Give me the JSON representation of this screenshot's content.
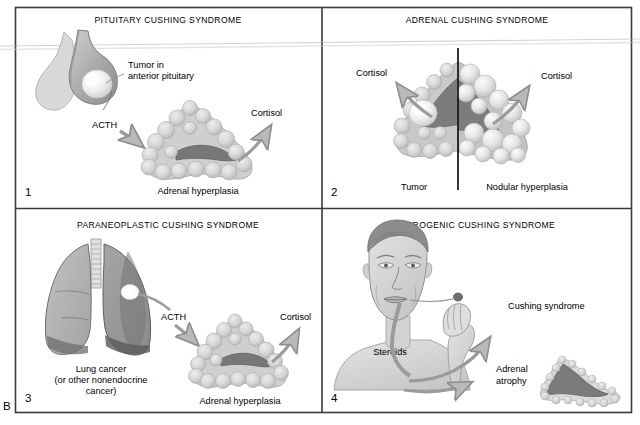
{
  "figure": {
    "panel_letter": "B",
    "background": "#ffffff",
    "frame_color": "#3a3a3a",
    "palette": {
      "cortex_light": "#d2d2d2",
      "cortex_mid": "#bdbdbd",
      "medulla_dark": "#6f6f6f",
      "nodule_light": "#e9e9e9",
      "tissue_gray": "#b5b5b5",
      "tissue_dark": "#8a8a8a",
      "arrow_gray": "#8d8d8d",
      "skin": "#dcdcdc",
      "hair_dark": "#808080",
      "text": "#1a1a1a"
    },
    "panels": [
      {
        "number": "1",
        "title": "PITUITARY CUSHING SYNDROME",
        "labels": [
          {
            "name": "tumor-label",
            "line1": "Tumor in",
            "line2": "anterior pituitary"
          },
          {
            "name": "acth-label",
            "text": "ACTH"
          },
          {
            "name": "cortisol-label",
            "text": "Cortisol"
          },
          {
            "name": "adrenal-caption",
            "text": "Adrenal hyperplasia"
          }
        ],
        "illustrations": [
          "pituitary-gland",
          "adrenal-hyperplasia-gland"
        ]
      },
      {
        "number": "2",
        "title": "ADRENAL CUSHING SYNDROME",
        "labels": [
          {
            "name": "cortisol-left-label",
            "text": "Cortisol"
          },
          {
            "name": "cortisol-right-label",
            "text": "Cortisol"
          },
          {
            "name": "tumor-caption",
            "text": "Tumor"
          },
          {
            "name": "nodular-caption",
            "text": "Nodular hyperplasia"
          }
        ],
        "illustrations": [
          "adrenal-tumor-gland",
          "adrenal-nodular-gland",
          "vertical-divider"
        ]
      },
      {
        "number": "3",
        "title": "PARANEOPLASTIC CUSHING SYNDROME",
        "labels": [
          {
            "name": "acth-label",
            "text": "ACTH"
          },
          {
            "name": "cortisol-label",
            "text": "Cortisol"
          },
          {
            "name": "lung-caption-line1",
            "text": "Lung cancer"
          },
          {
            "name": "lung-caption-line2",
            "text": "(or other nonendocrine"
          },
          {
            "name": "lung-caption-line3",
            "text": "cancer)"
          },
          {
            "name": "adrenal-caption",
            "text": "Adrenal hyperplasia"
          }
        ],
        "illustrations": [
          "lungs-with-tumor",
          "adrenal-hyperplasia-gland"
        ]
      },
      {
        "number": "4",
        "title": "IATROGENIC CUSHING SYNDROME",
        "labels": [
          {
            "name": "steroids-label",
            "text": "Steroids"
          },
          {
            "name": "cushing-syndrome-label",
            "text": "Cushing syndrome"
          },
          {
            "name": "adrenal-atrophy-label-line1",
            "text": "Adrenal"
          },
          {
            "name": "adrenal-atrophy-label-line2",
            "text": "atrophy"
          }
        ],
        "illustrations": [
          "man-taking-pill",
          "adrenal-atrophy-gland"
        ]
      }
    ]
  }
}
